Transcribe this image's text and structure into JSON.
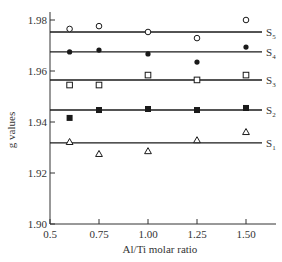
{
  "chart_data": {
    "type": "scatter",
    "title": "",
    "xlabel": "Al/Ti molar ratio",
    "ylabel": "g values",
    "xlim": [
      0.5,
      1.65
    ],
    "ylim": [
      1.9,
      1.98
    ],
    "xticks": [
      0.5,
      0.75,
      1.0,
      1.25,
      1.5
    ],
    "xtick_labels": [
      "0.5",
      "0.75",
      "1.00",
      "1.25",
      "1.50"
    ],
    "yticks": [
      1.9,
      1.92,
      1.94,
      1.96,
      1.98
    ],
    "ytick_labels": [
      "1.90",
      "1.92",
      "1.94",
      "1.96",
      "1.98"
    ],
    "grid": false,
    "legend_position": "inline labels at right end of each fitted line",
    "x": [
      0.6,
      0.75,
      1.0,
      1.25,
      1.5
    ],
    "series": [
      {
        "name": "S5",
        "marker": "open-circle",
        "fit_line": 1.9753,
        "values": [
          1.9765,
          1.9776,
          1.9753,
          1.9729,
          1.98
        ]
      },
      {
        "name": "S4",
        "marker": "filled-circle",
        "fit_line": 1.9675,
        "values": [
          1.9675,
          1.9682,
          1.9667,
          1.9635,
          1.9694
        ]
      },
      {
        "name": "S3",
        "marker": "open-square",
        "fit_line": 1.9565,
        "values": [
          1.9545,
          1.9545,
          1.9584,
          1.9565,
          1.9584
        ]
      },
      {
        "name": "S2",
        "marker": "filled-square",
        "fit_line": 1.9447,
        "values": [
          1.9416,
          1.9447,
          1.9451,
          1.9447,
          1.9455
        ]
      },
      {
        "name": "S1",
        "marker": "open-triangle",
        "fit_line": 1.9318,
        "values": [
          1.9322,
          1.9275,
          1.9286,
          1.9329,
          1.9361
        ]
      }
    ]
  },
  "labels": {
    "S5": {
      "main": "S",
      "sub": "5"
    },
    "S4": {
      "main": "S",
      "sub": "4"
    },
    "S3": {
      "main": "S",
      "sub": "3"
    },
    "S2": {
      "main": "S",
      "sub": "2"
    },
    "S1": {
      "main": "S",
      "sub": "1"
    }
  },
  "colors": {
    "ink": "#1a1a1a",
    "axis": "#333333",
    "background": "#ffffff"
  }
}
